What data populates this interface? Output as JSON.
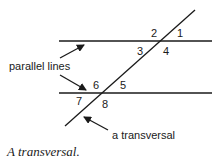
{
  "diagram": {
    "angle_labels": [
      "1",
      "2",
      "3",
      "4",
      "5",
      "6",
      "7",
      "8"
    ],
    "annotations": {
      "parallel_lines": "parallel lines",
      "transversal": "a transversal"
    },
    "caption": "A transversal.",
    "colors": {
      "stroke": "#1a1a1a",
      "background": "#ffffff"
    }
  }
}
